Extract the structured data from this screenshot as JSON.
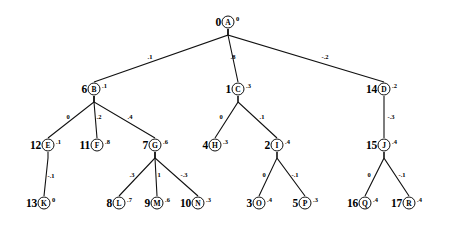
{
  "diagram": {
    "type": "tree",
    "stroke_color": "#111111",
    "background_color": "#ffffff",
    "nodes": [
      {
        "id": "A",
        "index": "0",
        "value": "0",
        "x": 228,
        "y": 22,
        "label_dx": -7,
        "value_dx": 8
      },
      {
        "id": "B",
        "index": "6",
        "value": ".1",
        "x": 94,
        "y": 89,
        "label_dx": -7,
        "value_dx": 8
      },
      {
        "id": "C",
        "index": "1",
        "value": ".3",
        "x": 238,
        "y": 89,
        "label_dx": -7,
        "value_dx": 8
      },
      {
        "id": "D",
        "index": "14",
        "value": ".2",
        "x": 384,
        "y": 89,
        "label_dx": -7,
        "value_dx": 8
      },
      {
        "id": "E",
        "index": "12",
        "value": ".1",
        "x": 48,
        "y": 145,
        "label_dx": -7,
        "value_dx": 8
      },
      {
        "id": "F",
        "index": "11",
        "value": ".8",
        "x": 97,
        "y": 145,
        "label_dx": -7,
        "value_dx": 8
      },
      {
        "id": "G",
        "index": "7",
        "value": ".6",
        "x": 155,
        "y": 145,
        "label_dx": -7,
        "value_dx": 8
      },
      {
        "id": "H",
        "index": "4",
        "value": ".3",
        "x": 215,
        "y": 145,
        "label_dx": -7,
        "value_dx": 8
      },
      {
        "id": "I",
        "index": "2",
        "value": ".4",
        "x": 277,
        "y": 145,
        "label_dx": -7,
        "value_dx": 8
      },
      {
        "id": "J",
        "index": "15",
        "value": ".4",
        "x": 384,
        "y": 145,
        "label_dx": -7,
        "value_dx": 8
      },
      {
        "id": "K",
        "index": "13",
        "value": "0",
        "x": 44,
        "y": 203,
        "label_dx": -7,
        "value_dx": 8
      },
      {
        "id": "L",
        "index": "8",
        "value": ".7",
        "x": 119,
        "y": 203,
        "label_dx": -7,
        "value_dx": 8
      },
      {
        "id": "M",
        "index": "9",
        "value": ".6",
        "x": 157,
        "y": 203,
        "label_dx": -7,
        "value_dx": 8
      },
      {
        "id": "N",
        "index": "10",
        "value": ".3",
        "x": 198,
        "y": 203,
        "label_dx": -7,
        "value_dx": 8
      },
      {
        "id": "O",
        "index": "3",
        "value": ".4",
        "x": 259,
        "y": 203,
        "label_dx": -7,
        "value_dx": 8
      },
      {
        "id": "P",
        "index": "5",
        "value": ".3",
        "x": 305,
        "y": 203,
        "label_dx": -7,
        "value_dx": 8
      },
      {
        "id": "Q",
        "index": "16",
        "value": ".4",
        "x": 365,
        "y": 203,
        "label_dx": -7,
        "value_dx": 8
      },
      {
        "id": "R",
        "index": "17",
        "value": ".4",
        "x": 409,
        "y": 203,
        "label_dx": -7,
        "value_dx": 8
      }
    ],
    "edges": [
      {
        "from": "A",
        "to": "B",
        "label": ".1",
        "lx": 150,
        "ly": 56
      },
      {
        "from": "A",
        "to": "C",
        "label": ".8",
        "lx": 233,
        "ly": 56
      },
      {
        "from": "A",
        "to": "D",
        "label": "-.2",
        "lx": 325,
        "ly": 56
      },
      {
        "from": "B",
        "to": "E",
        "label": "0",
        "lx": 68,
        "ly": 116
      },
      {
        "from": "B",
        "to": "F",
        "label": ".2",
        "lx": 99,
        "ly": 116
      },
      {
        "from": "B",
        "to": "G",
        "label": ".4",
        "lx": 130,
        "ly": 116
      },
      {
        "from": "C",
        "to": "H",
        "label": "0",
        "lx": 221,
        "ly": 116
      },
      {
        "from": "C",
        "to": "I",
        "label": ".1",
        "lx": 262,
        "ly": 116
      },
      {
        "from": "D",
        "to": "J",
        "label": "-.3",
        "lx": 391,
        "ly": 116
      },
      {
        "from": "E",
        "to": "K",
        "label": "-.1",
        "lx": 51,
        "ly": 175
      },
      {
        "from": "G",
        "to": "L",
        "label": ".3",
        "lx": 132,
        "ly": 174
      },
      {
        "from": "G",
        "to": "M",
        "label": "1",
        "lx": 159,
        "ly": 174
      },
      {
        "from": "G",
        "to": "N",
        "label": "-.3",
        "lx": 184,
        "ly": 174
      },
      {
        "from": "I",
        "to": "O",
        "label": "0",
        "lx": 264,
        "ly": 174
      },
      {
        "from": "I",
        "to": "P",
        "label": "-.1",
        "lx": 295,
        "ly": 174
      },
      {
        "from": "J",
        "to": "Q",
        "label": "0",
        "lx": 369,
        "ly": 174
      },
      {
        "from": "J",
        "to": "R",
        "label": "-.1",
        "lx": 402,
        "ly": 174
      }
    ]
  }
}
